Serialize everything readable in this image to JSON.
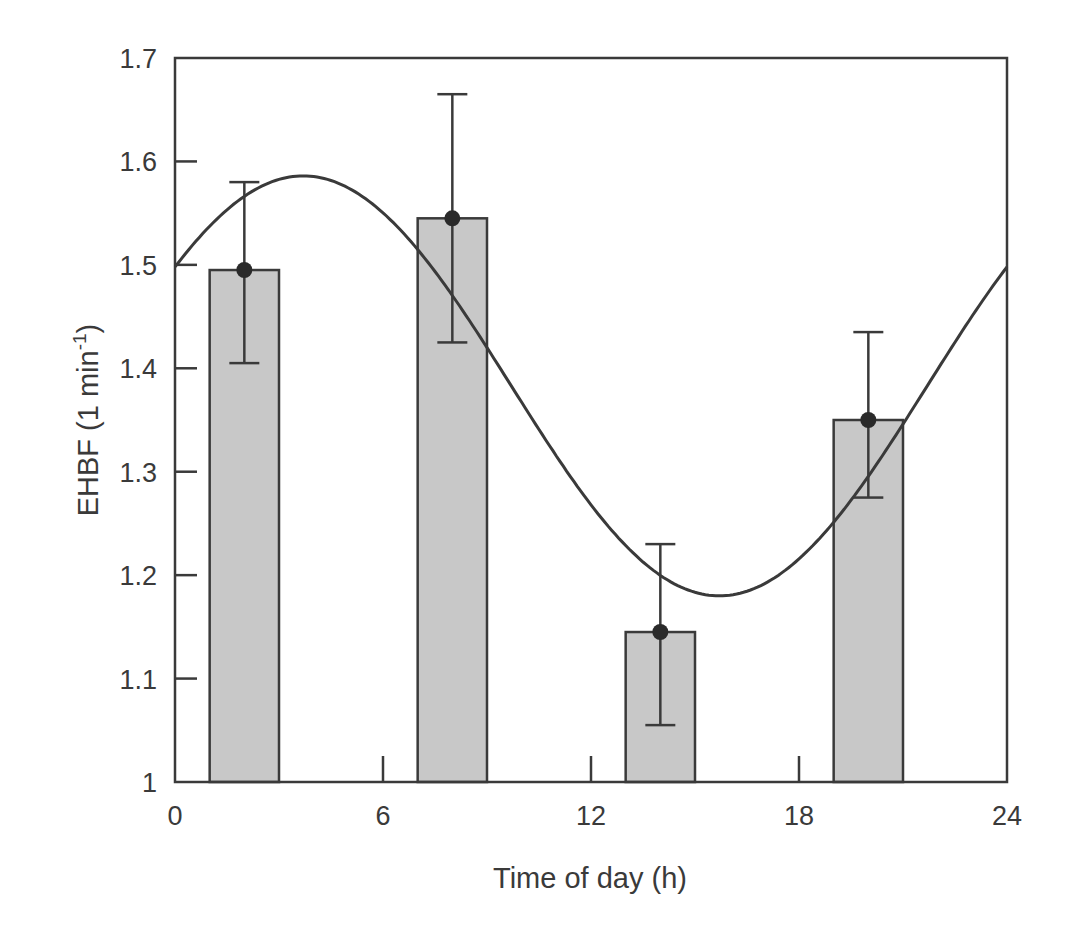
{
  "chart_data": {
    "type": "bar",
    "title": "",
    "xlabel": "Time of day (h)",
    "ylabel": "EHBF (1 min",
    "ylabel_superscript": "-1",
    "ylabel_close": ")",
    "xlim": [
      0,
      24
    ],
    "ylim": [
      1.0,
      1.7
    ],
    "x_ticks": [
      0,
      6,
      12,
      18,
      24
    ],
    "x_tick_labels": [
      "0",
      "6",
      "12",
      "18",
      "24"
    ],
    "y_ticks": [
      1.0,
      1.1,
      1.2,
      1.3,
      1.4,
      1.5,
      1.6,
      1.7
    ],
    "y_tick_labels": [
      "1",
      "1.1",
      "1.2",
      "1.3",
      "1.4",
      "1.5",
      "1.6",
      "1.7"
    ],
    "grid": false,
    "legend": null,
    "bar_width_h": 2,
    "series": [
      {
        "name": "EHBF mean",
        "type": "bar",
        "x": [
          2,
          8,
          14,
          20
        ],
        "values": [
          1.495,
          1.545,
          1.145,
          1.35
        ],
        "error_upper": [
          1.58,
          1.665,
          1.23,
          1.435
        ],
        "error_lower": [
          1.405,
          1.425,
          1.055,
          1.275
        ],
        "color": "#c8c8c8",
        "marker": "filled-circle"
      },
      {
        "name": "Cosinor fit",
        "type": "line",
        "mesor": 1.383,
        "amplitude": 0.203,
        "acrophase_h": 3.7,
        "period_h": 24,
        "color": "#3a3a3a"
      }
    ]
  },
  "colors": {
    "axis": "#3a3a3a",
    "bar_fill": "#c8c8c8",
    "bar_stroke": "#3a3a3a",
    "marker": "#2a2a2a",
    "curve": "#3a3a3a"
  }
}
